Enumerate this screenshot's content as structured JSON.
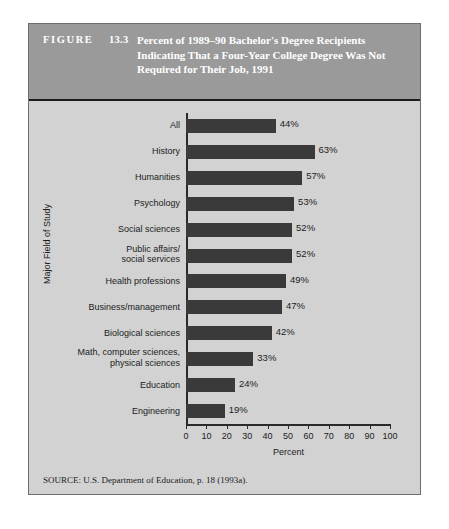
{
  "figure": {
    "label": "FIGURE",
    "number": "13.3",
    "title": "Percent of 1989–90 Bachelor's Degree Recipients Indicating That a Four-Year College Degree Was Not Required for Their Job, 1991",
    "source": "SOURCE: U.S. Department of Education, p. 18 (1993a)."
  },
  "colors": {
    "bar": "#3a3a3a",
    "header_band": "#9a9a9a",
    "body": "#d2d2d2",
    "frame": "#6e6e6e",
    "text": "#1c1c1c",
    "header_text": "#ffffff"
  },
  "chart_data": {
    "type": "bar",
    "orientation": "horizontal",
    "title": "Percent of 1989–90 Bachelor's Degree Recipients Indicating That a Four-Year College Degree Was Not Required for Their Job, 1991",
    "xlabel": "Percent",
    "ylabel": "Major Field of Study",
    "xlim": [
      0,
      100
    ],
    "xticks": [
      0,
      10,
      20,
      30,
      40,
      50,
      60,
      70,
      80,
      90,
      100
    ],
    "xtick_labels": [
      "0",
      "10",
      "20",
      "30",
      "40",
      "50",
      "60",
      "70",
      "80",
      "90",
      "100"
    ],
    "grid": false,
    "legend": false,
    "value_label_suffix": "%",
    "categories": [
      "All",
      "History",
      "Humanities",
      "Psychology",
      "Social sciences",
      "Public affairs/\nsocial services",
      "Health professions",
      "Business/management",
      "Biological sciences",
      "Math, computer sciences,\nphysical sciences",
      "Education",
      "Engineering"
    ],
    "values": [
      44,
      63,
      57,
      53,
      52,
      52,
      49,
      47,
      42,
      33,
      24,
      19
    ],
    "value_labels": [
      "44%",
      "63%",
      "57%",
      "53%",
      "52%",
      "52%",
      "49%",
      "47%",
      "42%",
      "33%",
      "24%",
      "19%"
    ]
  }
}
